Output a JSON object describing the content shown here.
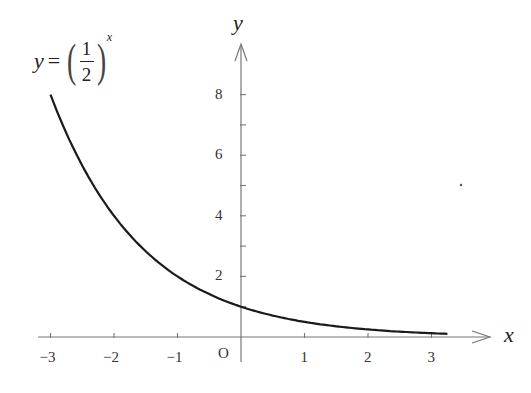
{
  "chart_data": {
    "type": "line",
    "title": "",
    "formula": {
      "lhs": "y",
      "eq": "=",
      "numerator": "1",
      "denominator": "2",
      "exponent": "x"
    },
    "xlabel": "x",
    "ylabel": "y",
    "origin_label": "O",
    "xlim": [
      -3.3,
      3.9
    ],
    "ylim": [
      -0.5,
      9.5
    ],
    "x_ticks": [
      -3,
      -2,
      -1,
      1,
      2,
      3
    ],
    "x_tick_labels": [
      "−3",
      "−2",
      "−1",
      "1",
      "2",
      "3"
    ],
    "y_ticks": [
      1,
      2,
      3,
      4,
      5,
      6,
      7,
      8
    ],
    "y_tick_labels": [
      "2",
      "4",
      "6",
      "8"
    ],
    "y_labeled_values": [
      2,
      4,
      6,
      8
    ],
    "grid": false,
    "legend": null,
    "series": [
      {
        "name": "y = (1/2)^x",
        "x": [
          -3,
          -2.5,
          -2,
          -1.5,
          -1,
          -0.5,
          0,
          0.5,
          1,
          1.5,
          2,
          2.5,
          3,
          3.25
        ],
        "y": [
          8,
          5.66,
          4,
          2.83,
          2,
          1.41,
          1,
          0.71,
          0.5,
          0.35,
          0.25,
          0.18,
          0.125,
          0.105
        ]
      }
    ]
  },
  "colors": {
    "curve": "#1a1a1a",
    "axis": "#777777",
    "text": "#333333"
  }
}
